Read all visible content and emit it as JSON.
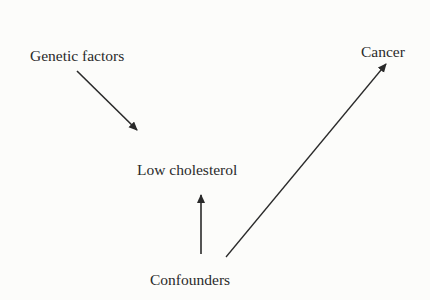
{
  "diagram": {
    "type": "causal-diagram",
    "nodes": [
      {
        "id": "genetic",
        "label": "Genetic factors",
        "x": 30,
        "y": 48
      },
      {
        "id": "cancer",
        "label": "Cancer",
        "x": 361,
        "y": 44
      },
      {
        "id": "lowchol",
        "label": "Low cholesterol",
        "x": 137,
        "y": 162
      },
      {
        "id": "confounders",
        "label": "Confounders",
        "x": 150,
        "y": 272
      }
    ],
    "edges": [
      {
        "from": "genetic",
        "to": "lowchol",
        "x1": 77,
        "y1": 71,
        "x2": 137,
        "y2": 130
      },
      {
        "from": "confounders",
        "to": "lowchol",
        "x1": 201,
        "y1": 254,
        "x2": 201,
        "y2": 195
      },
      {
        "from": "confounders",
        "to": "cancer",
        "x1": 226,
        "y1": 257,
        "x2": 386,
        "y2": 64
      }
    ],
    "colors": {
      "ink": "#2a2a2a",
      "background": "#fcfcfa"
    }
  }
}
